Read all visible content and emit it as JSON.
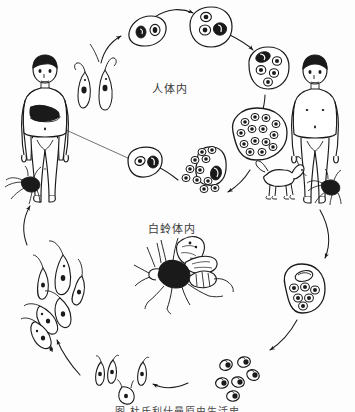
{
  "figure": {
    "domain_note": "scanned textbook line drawing",
    "width": 355,
    "height": 412,
    "background_color": "#fdfdfd",
    "ink_color": "#1a1a1a",
    "caption": "图  杜氏利什曼原虫生活史",
    "labels": {
      "human_host": "人体内",
      "sandfly_host": "白蛉体内"
    }
  },
  "hosts": {
    "patient": {
      "name": "infected-human",
      "note": "human figure with darkened hepatosplenomegaly region, sandfly at feet"
    },
    "healthy": {
      "name": "healthy-human",
      "note": "human figure with dog and sandfly at feet"
    },
    "dog": {
      "name": "dog-reservoir"
    },
    "sandfly": {
      "name": "sandfly-vector"
    }
  },
  "stages": [
    {
      "id": "amastigote-in-macrophage",
      "ring": "human",
      "angle_deg": 285
    },
    {
      "id": "amastigote-dividing-macrophage",
      "ring": "human",
      "angle_deg": 315
    },
    {
      "id": "macrophage-multiple-amastigotes",
      "ring": "human",
      "angle_deg": 350
    },
    {
      "id": "macrophage-packed-amastigotes",
      "ring": "human",
      "angle_deg": 25
    },
    {
      "id": "macrophage-rupturing",
      "ring": "human",
      "angle_deg": 70
    },
    {
      "id": "free-amastigotes",
      "ring": "human",
      "angle_deg": 105
    },
    {
      "id": "promastigotes-flagellated",
      "ring": "human",
      "angle_deg": 235
    },
    {
      "id": "amastigotes-ingested",
      "ring": "sandfly",
      "angle_deg": 75
    },
    {
      "id": "promastigotes-transforming",
      "ring": "sandfly",
      "angle_deg": 110
    },
    {
      "id": "promastigotes-multiplying",
      "ring": "sandfly",
      "angle_deg": 160
    },
    {
      "id": "macrophage-in-sandfly",
      "ring": "sandfly",
      "angle_deg": 20
    }
  ]
}
